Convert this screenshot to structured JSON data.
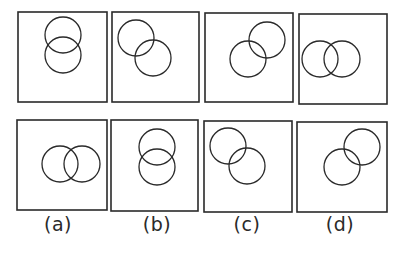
{
  "figure": {
    "stroke_color": "#2a2a2a",
    "problem_figures": [
      {
        "box": [
          18,
          12,
          89,
          90
        ],
        "circles": [
          [
            63,
            35,
            18
          ],
          [
            63,
            55,
            18
          ]
        ]
      },
      {
        "box": [
          112,
          12,
          87,
          90
        ],
        "circles": [
          [
            136,
            38,
            18
          ],
          [
            153,
            58,
            18
          ]
        ]
      },
      {
        "box": [
          205,
          13,
          88,
          89
        ],
        "circles": [
          [
            267,
            40,
            18
          ],
          [
            248,
            59,
            18
          ]
        ]
      },
      {
        "box": [
          299,
          14,
          88,
          90
        ],
        "circles": [
          [
            320,
            59,
            18
          ],
          [
            342,
            59,
            18
          ]
        ]
      }
    ],
    "answer_figures": [
      {
        "label": "(a)",
        "label_x": 58,
        "box": [
          17,
          120,
          90,
          90
        ],
        "circles": [
          [
            60,
            164,
            18
          ],
          [
            82,
            164,
            18
          ]
        ]
      },
      {
        "label": "(b)",
        "label_x": 157,
        "box": [
          111,
          120,
          87,
          91
        ],
        "circles": [
          [
            157,
            147,
            18
          ],
          [
            157,
            167,
            18
          ]
        ]
      },
      {
        "label": "(c)",
        "label_x": 247,
        "box": [
          204,
          121,
          88,
          91
        ],
        "circles": [
          [
            228,
            146,
            18
          ],
          [
            247,
            166,
            18
          ]
        ]
      },
      {
        "label": "(d)",
        "label_x": 340,
        "box": [
          297,
          122,
          90,
          90
        ],
        "circles": [
          [
            362,
            147,
            18
          ],
          [
            342,
            167,
            18
          ]
        ]
      }
    ]
  },
  "labels": {
    "a": "(a)",
    "b": "(b)",
    "c": "(c)",
    "d": "(d)"
  }
}
